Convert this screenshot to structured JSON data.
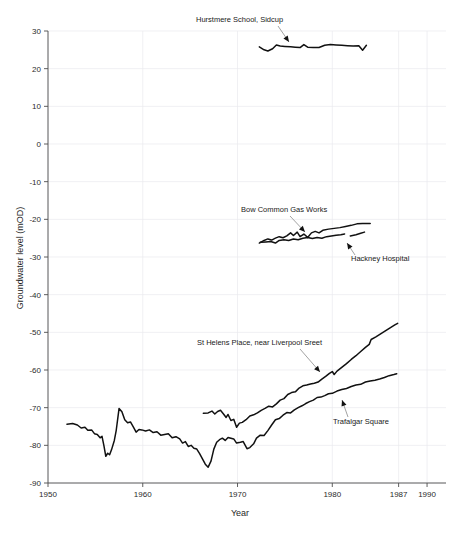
{
  "chart_data": {
    "type": "line",
    "title": "",
    "xlabel": "Year",
    "ylabel": "Groundwater level (mOD)",
    "xlim": [
      1950,
      1992
    ],
    "ylim": [
      -90,
      30
    ],
    "grid": true,
    "legend_position": "inline-annotations",
    "x_ticks": [
      1950,
      1960,
      1970,
      1980,
      1987,
      1990
    ],
    "x_tick_labels": [
      "1950",
      "1960",
      "1970",
      "1980",
      "1987",
      "1990"
    ],
    "y_ticks": [
      30,
      20,
      10,
      0,
      -10,
      -20,
      -30,
      -40,
      -50,
      -60,
      -70,
      -80,
      -90
    ],
    "y_tick_labels": [
      "30",
      "20",
      "10",
      "0",
      "-10",
      "-20",
      "-30",
      "-40",
      "-50",
      "-60",
      "-70",
      "-80",
      "-90"
    ],
    "series": [
      {
        "name": "Hurstmere School, Sidcup",
        "color": "#111111",
        "points": [
          [
            1972.3,
            25.8
          ],
          [
            1972.8,
            25.0
          ],
          [
            1973.2,
            24.7
          ],
          [
            1973.7,
            25.3
          ],
          [
            1974.1,
            26.3
          ],
          [
            1974.5,
            26.0
          ],
          [
            1975.0,
            25.9
          ],
          [
            1975.6,
            25.8
          ],
          [
            1976.1,
            25.7
          ],
          [
            1976.6,
            25.6
          ],
          [
            1977.0,
            26.4
          ],
          [
            1977.4,
            25.7
          ],
          [
            1978.0,
            25.6
          ],
          [
            1978.6,
            25.6
          ],
          [
            1979.2,
            26.2
          ],
          [
            1979.8,
            26.4
          ],
          [
            1980.4,
            26.3
          ],
          [
            1981.0,
            26.2
          ],
          [
            1981.6,
            26.1
          ],
          [
            1982.2,
            26.0
          ],
          [
            1982.8,
            26.1
          ],
          [
            1983.2,
            24.9
          ],
          [
            1983.6,
            26.2
          ]
        ]
      },
      {
        "name": "Bow Common Gas Works",
        "color": "#111111",
        "points": [
          [
            1972.3,
            -26.3
          ],
          [
            1972.8,
            -25.6
          ],
          [
            1973.2,
            -25.2
          ],
          [
            1973.6,
            -25.5
          ],
          [
            1974.0,
            -25.0
          ],
          [
            1974.4,
            -24.6
          ],
          [
            1974.8,
            -24.9
          ],
          [
            1975.2,
            -24.4
          ],
          [
            1975.6,
            -23.6
          ],
          [
            1975.9,
            -24.3
          ],
          [
            1976.3,
            -23.4
          ],
          [
            1976.6,
            -24.6
          ],
          [
            1977.0,
            -23.9
          ],
          [
            1977.4,
            -24.8
          ],
          [
            1977.8,
            -23.6
          ],
          [
            1978.2,
            -23.2
          ],
          [
            1978.6,
            -23.6
          ],
          [
            1979.0,
            -22.9
          ],
          [
            1979.6,
            -22.6
          ],
          [
            1980.2,
            -22.4
          ],
          [
            1980.8,
            -22.2
          ],
          [
            1981.4,
            -21.9
          ],
          [
            1982.0,
            -21.6
          ],
          [
            1982.6,
            -21.2
          ],
          [
            1983.2,
            -21.1
          ],
          [
            1984.0,
            -21.1
          ]
        ]
      },
      {
        "name": "Hackney Hospital",
        "color": "#111111",
        "points": [
          [
            1972.4,
            -26.1
          ],
          [
            1973.0,
            -26.0
          ],
          [
            1973.5,
            -25.9
          ],
          [
            1974.0,
            -26.3
          ],
          [
            1974.4,
            -25.6
          ],
          [
            1974.9,
            -25.4
          ],
          [
            1975.4,
            -25.6
          ],
          [
            1975.9,
            -25.2
          ],
          [
            1976.4,
            -25.4
          ],
          [
            1976.9,
            -25.0
          ],
          [
            1977.4,
            -24.8
          ],
          [
            1977.9,
            -25.1
          ],
          [
            1978.4,
            -24.8
          ],
          [
            1978.9,
            -25.0
          ],
          [
            1979.4,
            -24.6
          ],
          [
            1979.9,
            -24.4
          ],
          [
            1980.4,
            -24.2
          ],
          [
            1980.9,
            -24.1
          ],
          [
            1981.3,
            -23.9
          ]
        ],
        "segments": [
          [
            [
              1981.9,
              -24.4
            ],
            [
              1982.5,
              -24.1
            ],
            [
              1983.0,
              -23.7
            ],
            [
              1983.4,
              -23.4
            ]
          ]
        ]
      },
      {
        "name": "St Helens Place, near Liverpool Sreet",
        "color": "#111111",
        "points": [
          [
            1966.4,
            -71.5
          ],
          [
            1966.9,
            -71.4
          ],
          [
            1967.3,
            -70.9
          ],
          [
            1967.6,
            -71.7
          ],
          [
            1967.9,
            -71.0
          ],
          [
            1968.2,
            -70.7
          ],
          [
            1968.5,
            -71.6
          ],
          [
            1968.8,
            -72.6
          ],
          [
            1969.0,
            -71.8
          ],
          [
            1969.3,
            -73.4
          ],
          [
            1969.6,
            -73.1
          ],
          [
            1969.9,
            -75.2
          ],
          [
            1970.2,
            -74.1
          ],
          [
            1970.5,
            -73.9
          ],
          [
            1970.9,
            -73.2
          ],
          [
            1971.3,
            -72.2
          ],
          [
            1971.7,
            -71.9
          ],
          [
            1972.1,
            -71.4
          ],
          [
            1972.5,
            -70.7
          ],
          [
            1972.9,
            -70.2
          ],
          [
            1973.3,
            -69.6
          ],
          [
            1973.7,
            -69.8
          ],
          [
            1974.1,
            -69.0
          ],
          [
            1974.5,
            -68.0
          ],
          [
            1974.9,
            -67.6
          ],
          [
            1975.3,
            -66.5
          ],
          [
            1975.7,
            -66.0
          ],
          [
            1976.1,
            -65.8
          ],
          [
            1976.5,
            -64.8
          ],
          [
            1976.9,
            -64.2
          ],
          [
            1977.3,
            -64.0
          ],
          [
            1977.7,
            -63.7
          ],
          [
            1978.1,
            -63.5
          ],
          [
            1978.5,
            -63.2
          ],
          [
            1978.9,
            -62.4
          ],
          [
            1979.3,
            -61.7
          ],
          [
            1979.7,
            -60.9
          ],
          [
            1980.0,
            -60.4
          ],
          [
            1980.2,
            -61.2
          ],
          [
            1980.5,
            -60.3
          ],
          [
            1981.0,
            -59.3
          ],
          [
            1981.5,
            -58.3
          ],
          [
            1982.0,
            -57.2
          ],
          [
            1982.5,
            -56.2
          ],
          [
            1983.0,
            -55.1
          ],
          [
            1983.5,
            -54.0
          ],
          [
            1983.9,
            -53.2
          ],
          [
            1984.1,
            -51.9
          ],
          [
            1984.6,
            -51.2
          ],
          [
            1985.1,
            -50.4
          ],
          [
            1985.6,
            -49.6
          ],
          [
            1986.1,
            -48.8
          ],
          [
            1986.6,
            -48.0
          ],
          [
            1986.9,
            -47.6
          ]
        ]
      },
      {
        "name": "Trafalgar Square",
        "color": "#111111",
        "points": [
          [
            1952.0,
            -74.4
          ],
          [
            1952.6,
            -74.2
          ],
          [
            1953.1,
            -74.6
          ],
          [
            1953.5,
            -75.4
          ],
          [
            1953.9,
            -75.2
          ],
          [
            1954.2,
            -76.0
          ],
          [
            1954.6,
            -75.9
          ],
          [
            1954.9,
            -76.9
          ],
          [
            1955.2,
            -77.1
          ],
          [
            1955.5,
            -78.0
          ],
          [
            1955.7,
            -77.6
          ],
          [
            1955.9,
            -80.1
          ],
          [
            1956.1,
            -82.9
          ],
          [
            1956.3,
            -82.1
          ],
          [
            1956.5,
            -82.5
          ],
          [
            1956.7,
            -81.2
          ],
          [
            1957.0,
            -78.7
          ],
          [
            1957.2,
            -76.0
          ],
          [
            1957.5,
            -70.2
          ],
          [
            1957.8,
            -71.1
          ],
          [
            1958.1,
            -73.2
          ],
          [
            1958.4,
            -74.0
          ],
          [
            1958.7,
            -73.8
          ],
          [
            1959.0,
            -75.1
          ],
          [
            1959.3,
            -76.5
          ],
          [
            1959.6,
            -75.8
          ],
          [
            1959.9,
            -75.9
          ],
          [
            1960.3,
            -76.2
          ],
          [
            1960.7,
            -75.9
          ],
          [
            1961.1,
            -76.6
          ],
          [
            1961.5,
            -76.4
          ],
          [
            1961.9,
            -77.3
          ],
          [
            1962.3,
            -77.1
          ],
          [
            1962.7,
            -76.9
          ],
          [
            1963.1,
            -78.0
          ],
          [
            1963.5,
            -77.7
          ],
          [
            1963.9,
            -78.3
          ],
          [
            1964.2,
            -79.4
          ],
          [
            1964.5,
            -79.0
          ],
          [
            1964.8,
            -80.3
          ],
          [
            1965.1,
            -80.0
          ],
          [
            1965.4,
            -80.8
          ],
          [
            1965.7,
            -81.0
          ],
          [
            1966.0,
            -82.2
          ],
          [
            1966.3,
            -83.6
          ],
          [
            1966.6,
            -85.0
          ],
          [
            1966.9,
            -85.8
          ],
          [
            1967.2,
            -84.2
          ],
          [
            1967.5,
            -81.0
          ],
          [
            1967.8,
            -79.2
          ],
          [
            1968.1,
            -78.5
          ],
          [
            1968.4,
            -78.1
          ],
          [
            1968.7,
            -78.7
          ],
          [
            1969.0,
            -77.9
          ],
          [
            1969.3,
            -78.1
          ],
          [
            1969.6,
            -78.3
          ],
          [
            1969.9,
            -79.4
          ],
          [
            1970.3,
            -79.2
          ],
          [
            1970.6,
            -79.0
          ],
          [
            1971.0,
            -80.9
          ],
          [
            1971.3,
            -80.6
          ],
          [
            1971.7,
            -79.6
          ],
          [
            1972.0,
            -78.1
          ],
          [
            1972.4,
            -77.3
          ],
          [
            1972.8,
            -77.4
          ],
          [
            1973.2,
            -76.1
          ],
          [
            1973.6,
            -74.6
          ],
          [
            1974.0,
            -73.2
          ],
          [
            1974.4,
            -72.9
          ],
          [
            1974.8,
            -72.0
          ],
          [
            1975.2,
            -71.3
          ],
          [
            1975.6,
            -71.4
          ],
          [
            1976.0,
            -70.6
          ],
          [
            1976.4,
            -70.0
          ],
          [
            1976.8,
            -69.5
          ],
          [
            1977.2,
            -68.9
          ],
          [
            1977.6,
            -68.4
          ],
          [
            1978.0,
            -68.0
          ],
          [
            1978.4,
            -67.3
          ],
          [
            1978.8,
            -67.2
          ],
          [
            1979.2,
            -66.8
          ],
          [
            1979.6,
            -66.3
          ],
          [
            1980.0,
            -66.2
          ],
          [
            1980.5,
            -65.6
          ],
          [
            1981.0,
            -65.2
          ],
          [
            1981.5,
            -64.9
          ],
          [
            1982.0,
            -64.4
          ],
          [
            1982.5,
            -64.0
          ],
          [
            1983.0,
            -63.8
          ],
          [
            1983.5,
            -63.2
          ],
          [
            1984.0,
            -62.9
          ],
          [
            1984.5,
            -62.7
          ],
          [
            1985.0,
            -62.4
          ],
          [
            1985.5,
            -62.0
          ],
          [
            1986.0,
            -61.5
          ],
          [
            1986.5,
            -61.2
          ],
          [
            1986.8,
            -61.0
          ]
        ]
      }
    ],
    "annotations": [
      {
        "id": "hurstmere",
        "text": "Hurstmere School, Sidcup",
        "text_x": 196,
        "text_y": 22,
        "leader": [
          [
            278,
            26
          ],
          [
            289,
            42
          ]
        ],
        "head": [
          289,
          42
        ],
        "head_dir": "down"
      },
      {
        "id": "bow",
        "text": "Bow Common Gas Works",
        "text_x": 241,
        "text_y": 212,
        "leader": [
          [
            290,
            216
          ],
          [
            305,
            232
          ]
        ],
        "head": [
          305,
          232
        ],
        "head_dir": "down"
      },
      {
        "id": "hackney",
        "text": "Hackney Hospital",
        "text_x": 351,
        "text_y": 261,
        "leader": [
          [
            355,
            255
          ],
          [
            347,
            243
          ]
        ],
        "head": [
          347,
          243
        ],
        "head_dir": "down"
      },
      {
        "id": "sthelens",
        "text": "St Helens Place, near Liverpool Sreet",
        "text_x": 197,
        "text_y": 345,
        "leader": [
          [
            300,
            349
          ],
          [
            320,
            372
          ]
        ],
        "head": [
          320,
          372
        ],
        "head_dir": "down"
      },
      {
        "id": "trafalgar",
        "text": "Trafalgar Square",
        "text_x": 333,
        "text_y": 424,
        "leader": [
          [
            348,
            417
          ],
          [
            342,
            400
          ]
        ],
        "head": [
          342,
          400
        ],
        "head_dir": "down"
      }
    ]
  },
  "axes": {
    "x_title": "Year",
    "y_title": "Groundwater level (mOD)"
  },
  "caption": {
    "text": ""
  }
}
